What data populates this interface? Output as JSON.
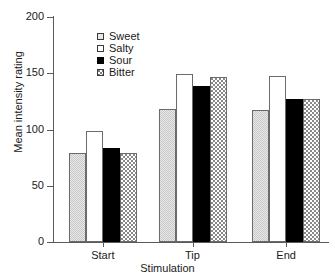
{
  "chart_data": {
    "type": "bar",
    "title": "",
    "xlabel": "Stimulation",
    "ylabel": "Mean intensity rating",
    "categories": [
      "Start",
      "Tip",
      "End"
    ],
    "series": [
      {
        "name": "Sweet",
        "fill": "lightgray",
        "values": [
          79,
          118.5,
          117.5
        ]
      },
      {
        "name": "Salty",
        "fill": "white",
        "values": [
          99,
          149,
          147.5
        ]
      },
      {
        "name": "Sour",
        "fill": "black",
        "values": [
          84,
          138.5,
          127
        ]
      },
      {
        "name": "Bitter",
        "fill": "stipple",
        "values": [
          79,
          146.5,
          127
        ]
      }
    ],
    "ylim": [
      0,
      200
    ],
    "yticks": [
      0,
      50,
      100,
      150,
      200
    ],
    "ytick_labels": [
      "0",
      "50",
      "100",
      "150",
      "200"
    ],
    "grid": false,
    "legend_position": "upper-left-inside"
  },
  "legend": {
    "items": [
      {
        "label": "Sweet"
      },
      {
        "label": "Salty"
      },
      {
        "label": "Sour"
      },
      {
        "label": "Bitter"
      }
    ]
  },
  "colors": {
    "axis": "#5a5a5a",
    "text": "#1a1a1a",
    "sweet": "#e8e8e8",
    "salty": "#ffffff",
    "sour": "#000000",
    "bitter": "#ffffff",
    "background": "#ffffff"
  }
}
